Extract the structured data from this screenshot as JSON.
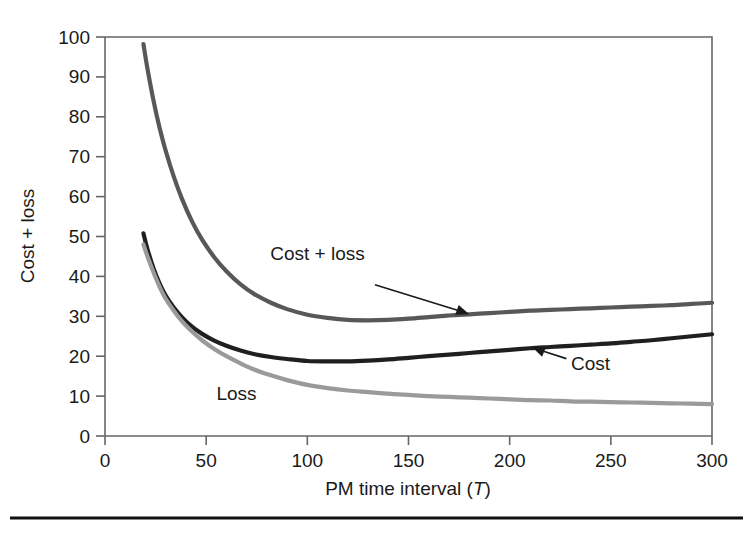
{
  "figure": {
    "background": "#ffffff",
    "has_bottom_rule": true,
    "bottom_rule_color": "#111111"
  },
  "chart_data": {
    "type": "line",
    "title": "",
    "xlabel": "PM time interval (T)",
    "xlabel_plain": "PM time interval",
    "xlabel_italic_symbol": "T",
    "ylabel": "Cost + loss",
    "xlim": [
      0,
      300
    ],
    "ylim": [
      0,
      100
    ],
    "xticks": [
      0,
      50,
      100,
      150,
      200,
      250,
      300
    ],
    "xtick_labels": [
      "0",
      "50",
      "100",
      "150",
      "200",
      "250",
      "300"
    ],
    "yticks": [
      0,
      10,
      20,
      30,
      40,
      50,
      60,
      70,
      80,
      90,
      100
    ],
    "ytick_labels": [
      "0",
      "10",
      "20",
      "30",
      "40",
      "50",
      "60",
      "70",
      "80",
      "90",
      "100"
    ],
    "grid": false,
    "legend": "none",
    "annotations": [
      {
        "text": "Cost + loss",
        "series": "Cost + loss",
        "label_x": 105,
        "label_y": 44,
        "arrow": true,
        "arrow_target_x": 180,
        "arrow_target_y": 30.5
      },
      {
        "text": "Cost",
        "series": "Cost",
        "label_x": 240,
        "label_y": 16.5,
        "arrow": true,
        "arrow_target_x": 211,
        "arrow_target_y": 22.3
      },
      {
        "text": "Loss",
        "series": "Loss",
        "label_x": 65,
        "label_y": 9,
        "arrow": false
      }
    ],
    "series": [
      {
        "name": "Cost + loss",
        "color": "#585858",
        "width": 4.2,
        "x": [
          19,
          21,
          24,
          27,
          30,
          34,
          38,
          43,
          48,
          54,
          60,
          67,
          74,
          82,
          90,
          100,
          110,
          120,
          130,
          140,
          150,
          160,
          170,
          180,
          190,
          200,
          210,
          220,
          230,
          240,
          250,
          260,
          270,
          280,
          290,
          300
        ],
        "y": [
          98.2,
          92.0,
          84.0,
          77.2,
          71.5,
          65.0,
          59.5,
          53.8,
          49.2,
          44.8,
          41.3,
          38.0,
          35.5,
          33.4,
          31.8,
          30.4,
          29.6,
          29.1,
          29.0,
          29.1,
          29.4,
          29.8,
          30.2,
          30.5,
          30.8,
          31.1,
          31.4,
          31.6,
          31.8,
          32.0,
          32.2,
          32.4,
          32.6,
          32.8,
          33.1,
          33.4
        ]
      },
      {
        "name": "Cost",
        "color": "#1f1f1f",
        "width": 4.2,
        "x": [
          19,
          21,
          24,
          27,
          30,
          34,
          38,
          43,
          48,
          54,
          60,
          67,
          74,
          82,
          90,
          100,
          110,
          120,
          130,
          140,
          150,
          160,
          170,
          180,
          190,
          200,
          210,
          220,
          230,
          240,
          250,
          260,
          270,
          280,
          290,
          300
        ],
        "y": [
          50.8,
          46.8,
          42.0,
          38.2,
          35.2,
          32.2,
          29.8,
          27.4,
          25.6,
          23.9,
          22.6,
          21.4,
          20.5,
          19.8,
          19.3,
          18.8,
          18.7,
          18.7,
          18.9,
          19.2,
          19.6,
          20.0,
          20.4,
          20.8,
          21.2,
          21.6,
          22.0,
          22.3,
          22.6,
          22.9,
          23.2,
          23.6,
          24.0,
          24.5,
          25.0,
          25.5
        ]
      },
      {
        "name": "Loss",
        "color": "#9a9a9a",
        "width": 4.2,
        "x": [
          19,
          21,
          24,
          27,
          30,
          34,
          38,
          43,
          48,
          54,
          60,
          67,
          74,
          82,
          90,
          100,
          110,
          120,
          130,
          140,
          150,
          160,
          170,
          180,
          190,
          200,
          210,
          220,
          230,
          240,
          250,
          260,
          270,
          280,
          290,
          300
        ],
        "y": [
          48.0,
          45.0,
          41.0,
          37.4,
          34.4,
          31.4,
          28.8,
          26.2,
          24.0,
          21.8,
          20.0,
          18.2,
          16.6,
          15.2,
          14.0,
          12.8,
          12.0,
          11.4,
          11.0,
          10.6,
          10.3,
          10.0,
          9.8,
          9.6,
          9.4,
          9.2,
          9.0,
          8.9,
          8.7,
          8.6,
          8.5,
          8.4,
          8.3,
          8.2,
          8.1,
          8.0
        ]
      }
    ]
  }
}
